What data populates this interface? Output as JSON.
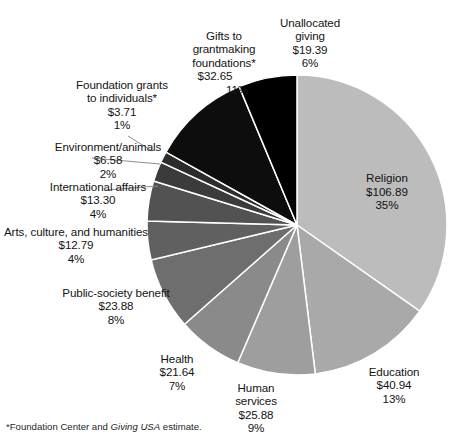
{
  "figure": {
    "footnote_prefix": "*Foundation Center and ",
    "footnote_italic": "Giving USA",
    "footnote_suffix": " estimate."
  },
  "chart_data": {
    "type": "pie",
    "title": "",
    "subtitle": "",
    "xlabel": "",
    "ylabel": "",
    "grid": false,
    "legend_position": "none",
    "value_prefix": "$",
    "units": "billions of dollars",
    "start_angle_deg": 0,
    "direction": "clockwise",
    "total_value": 307.65,
    "labels": [
      "Religion",
      "Education",
      "Human services",
      "Health",
      "Public-society benefit",
      "Arts, culture, and humanities",
      "International affairs",
      "Environment/animals",
      "Foundation grants to individuals*",
      "Gifts to grantmaking foundations*",
      "Unallocated giving"
    ],
    "values": [
      106.89,
      40.94,
      25.88,
      21.64,
      23.88,
      12.79,
      13.3,
      6.58,
      3.71,
      32.65,
      19.39
    ],
    "percent_labels": [
      "35%",
      "13%",
      "9%",
      "7%",
      "8%",
      "4%",
      "4%",
      "2%",
      "1%",
      "11%",
      "6%"
    ],
    "amount_labels": [
      "$106.89",
      "$40.94",
      "$25.88",
      "$21.64",
      "$23.88",
      "$12.79",
      "$13.30",
      "$6.58",
      "$3.71",
      "$32.65",
      "$19.39"
    ],
    "colors": [
      "#bcbcbc",
      "#a9a9a9",
      "#9e9e9e",
      "#8a8a8a",
      "#6e6e6e",
      "#606060",
      "#525252",
      "#3b3b3b",
      "#2c2c2c",
      "#0d0d0d",
      "#000000"
    ],
    "slice_order_clockwise_from_12": [
      "Religion",
      "Education",
      "Human services",
      "Health",
      "Public-society benefit",
      "Arts, culture, and humanities",
      "International affairs",
      "Environment/animals",
      "Foundation grants to individuals*",
      "Gifts to grantmaking foundations*",
      "Unallocated giving"
    ]
  },
  "slices": {
    "religion": {
      "name": "Religion",
      "amount": "$106.89",
      "pct": "35%"
    },
    "education": {
      "name": "Education",
      "amount": "$40.94",
      "pct": "13%"
    },
    "human_services": {
      "name_l1": "Human",
      "name_l2": "services",
      "amount": "$25.88",
      "pct": "9%"
    },
    "health": {
      "name": "Health",
      "amount": "$21.64",
      "pct": "7%"
    },
    "public_society": {
      "name": "Public-society benefit",
      "amount": "$23.88",
      "pct": "8%"
    },
    "arts": {
      "name": "Arts, culture, and humanities",
      "amount": "$12.79",
      "pct": "4%"
    },
    "international": {
      "name": "International affairs",
      "amount": "$13.30",
      "pct": "4%"
    },
    "environment": {
      "name": "Environment/animals",
      "amount": "$6.58",
      "pct": "2%"
    },
    "foundation_individuals": {
      "name_l1": "Foundation grants",
      "name_l2": "to individuals*",
      "amount": "$3.71",
      "pct": "1%"
    },
    "grantmaking": {
      "name_l1": "Gifts to",
      "name_l2": "grantmaking",
      "name_l3": "foundations*",
      "amount": "$32.65",
      "pct": "11%"
    },
    "unallocated": {
      "name_l1": "Unallocated",
      "name_l2": "giving",
      "amount": "$19.39",
      "pct": "6%"
    }
  }
}
